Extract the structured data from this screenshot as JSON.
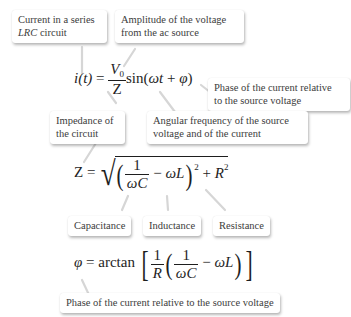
{
  "callouts": {
    "current": {
      "line1": "Current in a series",
      "line2_italic": "LRC",
      "line2_rest": " circuit"
    },
    "amplitude": {
      "line1": "Amplitude of the voltage",
      "line2": "from the ac source"
    },
    "phase_top": {
      "line1": "Phase of the current relative",
      "line2": "to the source voltage"
    },
    "impedance": {
      "line1": "Impedance of",
      "line2": "the circuit"
    },
    "angular": {
      "line1": "Angular frequency of the source",
      "line2": "voltage and of the current"
    },
    "capacitance": {
      "text": "Capacitance"
    },
    "inductance": {
      "text": "Inductance"
    },
    "resistance": {
      "text": "Resistance"
    },
    "phase_bottom": {
      "text": "Phase of the current relative to the source voltage"
    }
  },
  "equations": {
    "current": {
      "lhs": "i(t)",
      "equals": "=",
      "num": "V",
      "num_sub": "0",
      "den": "Z",
      "func": "sin",
      "arg_open": "(",
      "omega_t": "ωt",
      "plus": "+",
      "phi": "φ",
      "arg_close": ")"
    },
    "impedance": {
      "lhs": "Z",
      "equals": "=",
      "one": "1",
      "omega_c": "ωC",
      "minus": "−",
      "omega_l": "ωL",
      "square": "2",
      "plus": "+",
      "r": "R",
      "r_square": "2"
    },
    "phase": {
      "lhs": "φ",
      "equals": "=",
      "func": "arctan",
      "one_a": "1",
      "r": "R",
      "one_b": "1",
      "omega_c": "ωC",
      "minus": "−",
      "omega_l": "ωL"
    }
  },
  "colors": {
    "background": "#ffffff",
    "callout_bg": "#ffffff",
    "callout_text": "#3c3c3c",
    "equation_text": "#1e1e1e",
    "leader_line": "#d8d8d8"
  }
}
